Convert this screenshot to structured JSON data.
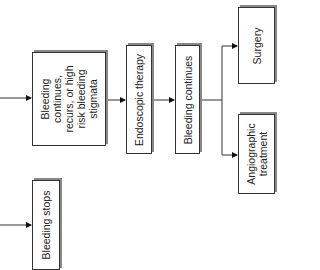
{
  "diagram": {
    "orientation": "rotated-90-ccw",
    "nodes": [
      {
        "id": "bleeding_continues_high_risk",
        "lines": [
          "Bleeding",
          "continues,",
          "recurs, or high",
          "risk bleeding",
          "stigmata"
        ]
      },
      {
        "id": "endoscopic_therapy",
        "label": "Endoscopic therapy"
      },
      {
        "id": "bleeding_continues",
        "label": "Bleeding continues"
      },
      {
        "id": "surgery",
        "label": "Surgery"
      },
      {
        "id": "angiographic_treatment",
        "lines": [
          "Angiographic",
          "treatment"
        ]
      },
      {
        "id": "bleeding_stops",
        "label": "Bleeding stops"
      }
    ],
    "edges": [
      {
        "from": "(incoming)",
        "to": "bleeding_continues_high_risk"
      },
      {
        "from": "bleeding_continues_high_risk",
        "to": "endoscopic_therapy"
      },
      {
        "from": "endoscopic_therapy",
        "to": "bleeding_continues"
      },
      {
        "from": "bleeding_continues",
        "to": "surgery"
      },
      {
        "from": "bleeding_continues",
        "to": "angiographic_treatment"
      },
      {
        "from": "(incoming)",
        "to": "bleeding_stops"
      }
    ]
  }
}
